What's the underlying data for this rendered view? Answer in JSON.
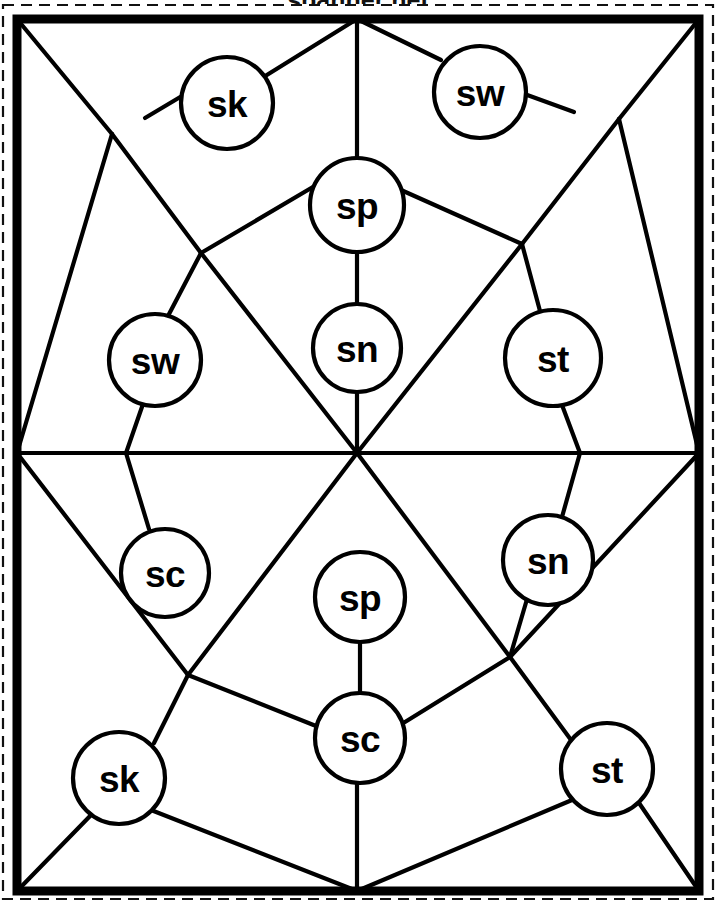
{
  "figure": {
    "title_clipped": "spanner net",
    "background_color": "#ffffff",
    "line_color": "#000000",
    "canvas": {
      "width": 716,
      "height": 904
    },
    "scan_border": {
      "x": 3,
      "y": 5,
      "width": 710,
      "height": 894,
      "dash": "11 7"
    },
    "page_frame": {
      "x": 17,
      "y": 19,
      "width": 682,
      "height": 872
    },
    "hub": {
      "x": 357,
      "y": 453
    }
  },
  "nodes": [
    {
      "id": "n1",
      "label": "sk",
      "cx": 227,
      "cy": 103,
      "r": 46
    },
    {
      "id": "n2",
      "label": "sw",
      "cx": 480,
      "cy": 92,
      "r": 46
    },
    {
      "id": "n3",
      "label": "sp",
      "cx": 357,
      "cy": 205,
      "r": 47
    },
    {
      "id": "n4",
      "label": "sn",
      "cx": 357,
      "cy": 348,
      "r": 44
    },
    {
      "id": "n5",
      "label": "sw",
      "cx": 155,
      "cy": 360,
      "r": 46
    },
    {
      "id": "n6",
      "label": "st",
      "cx": 553,
      "cy": 358,
      "r": 48
    },
    {
      "id": "n7",
      "label": "sc",
      "cx": 165,
      "cy": 573,
      "r": 44
    },
    {
      "id": "n8",
      "label": "sn",
      "cx": 548,
      "cy": 560,
      "r": 45
    },
    {
      "id": "n9",
      "label": "sp",
      "cx": 360,
      "cy": 597,
      "r": 45
    },
    {
      "id": "n10",
      "label": "sc",
      "cx": 360,
      "cy": 738,
      "r": 45
    },
    {
      "id": "n11",
      "label": "sk",
      "cx": 119,
      "cy": 778,
      "r": 46
    },
    {
      "id": "n12",
      "label": "st",
      "cx": 607,
      "cy": 769,
      "r": 46
    }
  ],
  "junctions": [
    {
      "id": "j-top-left",
      "x": 112,
      "y": 134
    },
    {
      "id": "j-mid-left",
      "x": 201,
      "y": 253
    },
    {
      "id": "j-top-right",
      "x": 619,
      "y": 119
    },
    {
      "id": "j-mid-right",
      "x": 522,
      "y": 244
    },
    {
      "id": "j-low-left",
      "x": 188,
      "y": 675
    },
    {
      "id": "j-low-right",
      "x": 510,
      "y": 657
    },
    {
      "id": "j-west",
      "x": 17,
      "y": 453
    },
    {
      "id": "j-east",
      "x": 699,
      "y": 453
    },
    {
      "id": "j-north",
      "x": 357,
      "y": 19
    },
    {
      "id": "j-south",
      "x": 357,
      "y": 891
    },
    {
      "id": "j-corner-nw",
      "x": 17,
      "y": 19
    },
    {
      "id": "j-corner-ne",
      "x": 699,
      "y": 19
    },
    {
      "id": "j-corner-sw",
      "x": 17,
      "y": 891
    },
    {
      "id": "j-corner-se",
      "x": 699,
      "y": 891
    }
  ],
  "edges": [
    {
      "from": [
        357,
        19
      ],
      "to": [
        262,
        78
      ]
    },
    {
      "from": [
        357,
        19
      ],
      "to": [
        357,
        158
      ]
    },
    {
      "from": [
        357,
        19
      ],
      "to": [
        441,
        60
      ]
    },
    {
      "from": [
        192,
        90
      ],
      "to": [
        145,
        118
      ]
    },
    {
      "from": [
        112,
        134
      ],
      "to": [
        17,
        19
      ]
    },
    {
      "from": [
        112,
        134
      ],
      "to": [
        17,
        453
      ]
    },
    {
      "from": [
        112,
        134
      ],
      "to": [
        201,
        253
      ]
    },
    {
      "from": [
        201,
        253
      ],
      "to": [
        318,
        184
      ]
    },
    {
      "from": [
        201,
        253
      ],
      "to": [
        357,
        453
      ]
    },
    {
      "from": [
        201,
        253
      ],
      "to": [
        168,
        316
      ]
    },
    {
      "from": [
        519,
        92
      ],
      "to": [
        574,
        112
      ]
    },
    {
      "from": [
        619,
        119
      ],
      "to": [
        699,
        19
      ]
    },
    {
      "from": [
        619,
        119
      ],
      "to": [
        522,
        244
      ]
    },
    {
      "from": [
        619,
        119
      ],
      "to": [
        699,
        453
      ]
    },
    {
      "from": [
        522,
        244
      ],
      "to": [
        401,
        190
      ]
    },
    {
      "from": [
        522,
        244
      ],
      "to": [
        357,
        453
      ]
    },
    {
      "from": [
        522,
        244
      ],
      "to": [
        540,
        311
      ]
    },
    {
      "from": [
        357,
        252
      ],
      "to": [
        357,
        304
      ]
    },
    {
      "from": [
        357,
        392
      ],
      "to": [
        357,
        453
      ]
    },
    {
      "from": [
        143,
        404
      ],
      "to": [
        126,
        453
      ]
    },
    {
      "from": [
        126,
        453
      ],
      "to": [
        149,
        529
      ]
    },
    {
      "from": [
        17,
        453
      ],
      "to": [
        699,
        453
      ]
    },
    {
      "from": [
        562,
        405
      ],
      "to": [
        580,
        453
      ]
    },
    {
      "from": [
        580,
        453
      ],
      "to": [
        562,
        517
      ]
    },
    {
      "from": [
        17,
        453
      ],
      "to": [
        188,
        675
      ]
    },
    {
      "from": [
        188,
        675
      ],
      "to": [
        357,
        453
      ]
    },
    {
      "from": [
        188,
        675
      ],
      "to": [
        154,
        743
      ]
    },
    {
      "from": [
        188,
        675
      ],
      "to": [
        316,
        726
      ]
    },
    {
      "from": [
        357,
        453
      ],
      "to": [
        510,
        657
      ]
    },
    {
      "from": [
        510,
        657
      ],
      "to": [
        699,
        453
      ]
    },
    {
      "from": [
        510,
        657
      ],
      "to": [
        405,
        722
      ]
    },
    {
      "from": [
        510,
        657
      ],
      "to": [
        574,
        744
      ]
    },
    {
      "from": [
        530,
        589
      ],
      "to": [
        510,
        657
      ]
    },
    {
      "from": [
        360,
        642
      ],
      "to": [
        360,
        693
      ]
    },
    {
      "from": [
        17,
        891
      ],
      "to": [
        92,
        814
      ]
    },
    {
      "from": [
        17,
        891
      ],
      "to": [
        17,
        453
      ]
    },
    {
      "from": [
        151,
        810
      ],
      "to": [
        357,
        891
      ]
    },
    {
      "from": [
        357,
        891
      ],
      "to": [
        357,
        783
      ]
    },
    {
      "from": [
        357,
        891
      ],
      "to": [
        572,
        800
      ]
    },
    {
      "from": [
        637,
        800
      ],
      "to": [
        699,
        891
      ]
    },
    {
      "from": [
        699,
        891
      ],
      "to": [
        699,
        453
      ]
    }
  ]
}
